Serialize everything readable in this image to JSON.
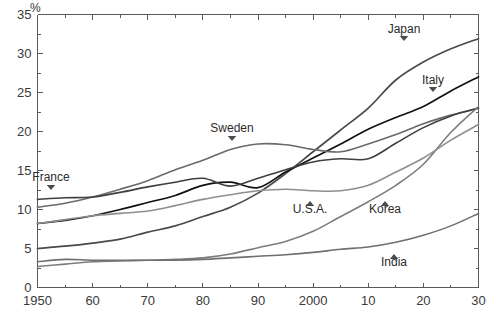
{
  "chart_data": {
    "type": "line",
    "title": "",
    "subtitle": "",
    "xlabel": "",
    "ylabel": "%",
    "unit_label": "%",
    "xlim": [
      1950,
      2030
    ],
    "ylim": [
      0,
      35
    ],
    "x_tick_labels": [
      "1950",
      "60",
      "70",
      "80",
      "90",
      "2000",
      "10",
      "20",
      "30"
    ],
    "x_tick_values": [
      1950,
      1960,
      1970,
      1980,
      1990,
      2000,
      2010,
      2020,
      2030
    ],
    "x_minor_step": 5,
    "y_tick_labels": [
      "0",
      "5",
      "10",
      "15",
      "20",
      "25",
      "30",
      "35"
    ],
    "y_tick_values": [
      0,
      5,
      10,
      15,
      20,
      25,
      30,
      35
    ],
    "grid": false,
    "legend": "inline-annotations",
    "legend_position": "inline",
    "x": [
      1950,
      1955,
      1960,
      1965,
      1970,
      1975,
      1980,
      1985,
      1990,
      1995,
      2000,
      2005,
      2010,
      2015,
      2020,
      2025,
      2030
    ],
    "series": [
      {
        "name": "Japan",
        "color": "#4a4a4a",
        "width": 1.7,
        "label": "Japan",
        "label_x": 404,
        "label_y": 33,
        "marker": "down-triangle",
        "marker_x": 404,
        "marker_y": 41,
        "values": [
          5.0,
          5.3,
          5.7,
          6.2,
          7.1,
          7.9,
          9.1,
          10.3,
          12.1,
          14.6,
          17.4,
          20.2,
          23.0,
          26.6,
          28.9,
          30.6,
          31.9
        ]
      },
      {
        "name": "Italy",
        "color": "#111111",
        "width": 1.7,
        "label": "Italy",
        "label_x": 433,
        "label_y": 84,
        "marker": "down-triangle",
        "marker_x": 433,
        "marker_y": 92,
        "values": [
          8.2,
          8.6,
          9.2,
          10.0,
          10.9,
          11.8,
          13.1,
          13.5,
          12.8,
          14.8,
          16.6,
          18.4,
          20.3,
          21.8,
          23.2,
          25.2,
          27.0
        ]
      },
      {
        "name": "Sweden",
        "color": "#6a6a6a",
        "width": 1.6,
        "label": "Sweden",
        "label_x": 232,
        "label_y": 132,
        "marker": "down-triangle",
        "marker_x": 232,
        "marker_y": 141,
        "values": [
          10.3,
          10.8,
          11.6,
          12.6,
          13.7,
          15.1,
          16.3,
          17.7,
          18.4,
          18.3,
          17.7,
          17.4,
          18.4,
          19.6,
          21.0,
          22.1,
          23.0
        ]
      },
      {
        "name": "France",
        "color": "#3f3f3f",
        "width": 1.6,
        "label": "France",
        "label_x": 51,
        "label_y": 181,
        "marker": "down-triangle",
        "marker_x": 51,
        "marker_y": 190,
        "values": [
          11.3,
          11.5,
          11.6,
          12.2,
          12.9,
          13.5,
          14.0,
          13.0,
          14.0,
          15.1,
          16.1,
          16.5,
          16.5,
          18.5,
          20.5,
          22.0,
          23.0
        ]
      },
      {
        "name": "Korea",
        "color": "#7d7d7d",
        "width": 1.6,
        "label": "Korea",
        "label_x": 385,
        "label_y": 213,
        "marker": "up-triangle",
        "marker_x": 385,
        "marker_y": 201,
        "values": [
          2.7,
          3.0,
          3.3,
          3.4,
          3.5,
          3.6,
          3.8,
          4.3,
          5.1,
          5.9,
          7.2,
          9.1,
          11.0,
          13.1,
          15.8,
          19.9,
          23.2
        ]
      },
      {
        "name": "U.S.A.",
        "color": "#8e8e8e",
        "width": 1.6,
        "label": "U.S.A.",
        "label_x": 310,
        "label_y": 213,
        "marker": "up-triangle",
        "marker_x": 310,
        "marker_y": 201,
        "values": [
          8.2,
          8.7,
          9.2,
          9.5,
          9.8,
          10.5,
          11.3,
          11.9,
          12.4,
          12.6,
          12.4,
          12.4,
          13.1,
          14.8,
          16.6,
          18.9,
          20.9
        ]
      },
      {
        "name": "India",
        "color": "#6f6f6f",
        "width": 1.6,
        "label": "India",
        "label_x": 394,
        "label_y": 266,
        "marker": "up-triangle",
        "marker_x": 394,
        "marker_y": 254,
        "values": [
          3.3,
          3.6,
          3.5,
          3.5,
          3.5,
          3.5,
          3.6,
          3.8,
          4.0,
          4.2,
          4.5,
          4.9,
          5.2,
          5.8,
          6.7,
          7.9,
          9.5
        ]
      }
    ]
  },
  "axes": {
    "unit": "%",
    "x_labels": [
      "1950",
      "60",
      "70",
      "80",
      "90",
      "2000",
      "10",
      "20",
      "30"
    ],
    "y_labels": [
      "0",
      "5",
      "10",
      "15",
      "20",
      "25",
      "30",
      "35"
    ]
  }
}
